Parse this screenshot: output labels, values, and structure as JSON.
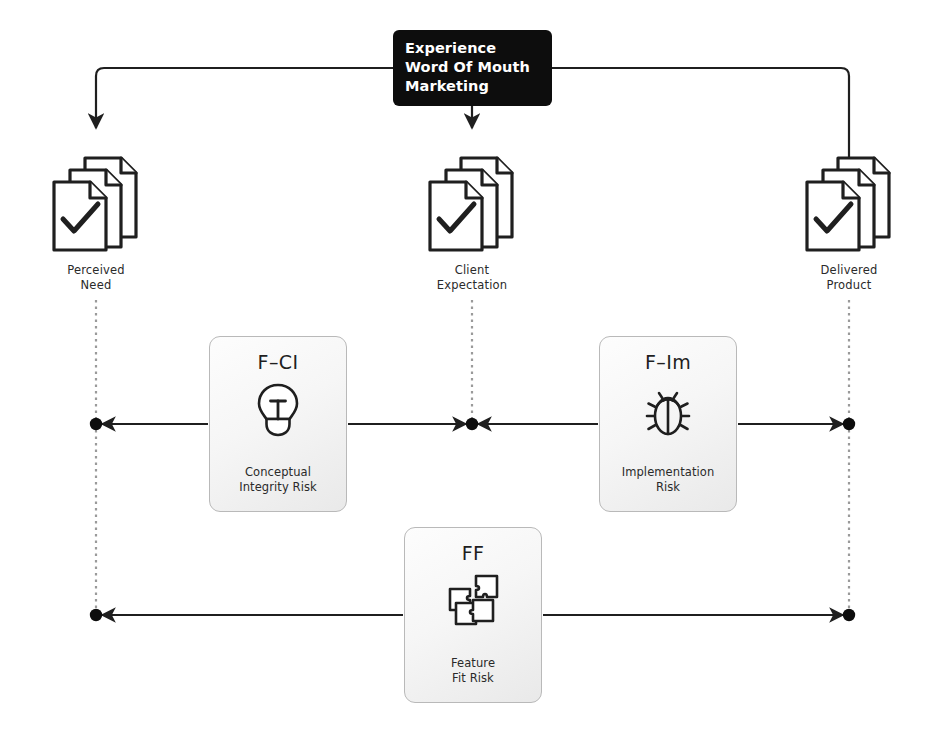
{
  "diagram": {
    "title_box": {
      "name": "experience-word-of-mouth-marketing",
      "lines": [
        "Experience",
        "Word Of Mouth",
        "Marketing"
      ]
    },
    "nodes": [
      {
        "id": "perceived-need",
        "icon": "document-stack-check-icon",
        "label_line1": "Perceived",
        "label_line2": "Need"
      },
      {
        "id": "client-expectation",
        "icon": "document-stack-check-icon",
        "label_line1": "Client",
        "label_line2": "Expectation"
      },
      {
        "id": "delivered-product",
        "icon": "document-stack-check-icon",
        "label_line1": "Delivered",
        "label_line2": "Product"
      }
    ],
    "cards": [
      {
        "id": "f-ci",
        "code": "F–CI",
        "icon": "lightbulb-icon",
        "label_line1": "Conceptual",
        "label_line2": "Integrity Risk"
      },
      {
        "id": "f-im",
        "code": "F–Im",
        "icon": "bug-icon",
        "label_line1": "Implementation",
        "label_line2": "Risk"
      },
      {
        "id": "ff",
        "code": "FF",
        "icon": "puzzle-pieces-icon",
        "label_line1": "Feature",
        "label_line2": "Fit Risk"
      }
    ],
    "colors": {
      "box_fill": "#0d0d0d",
      "box_text": "#ffffff",
      "line_solid": "#1f1f1f",
      "line_dotted": "#9a9a9a",
      "card_border": "#b9b9b9",
      "icon_stroke": "#1f1f1f",
      "label_text": "#2a2a2a"
    }
  }
}
